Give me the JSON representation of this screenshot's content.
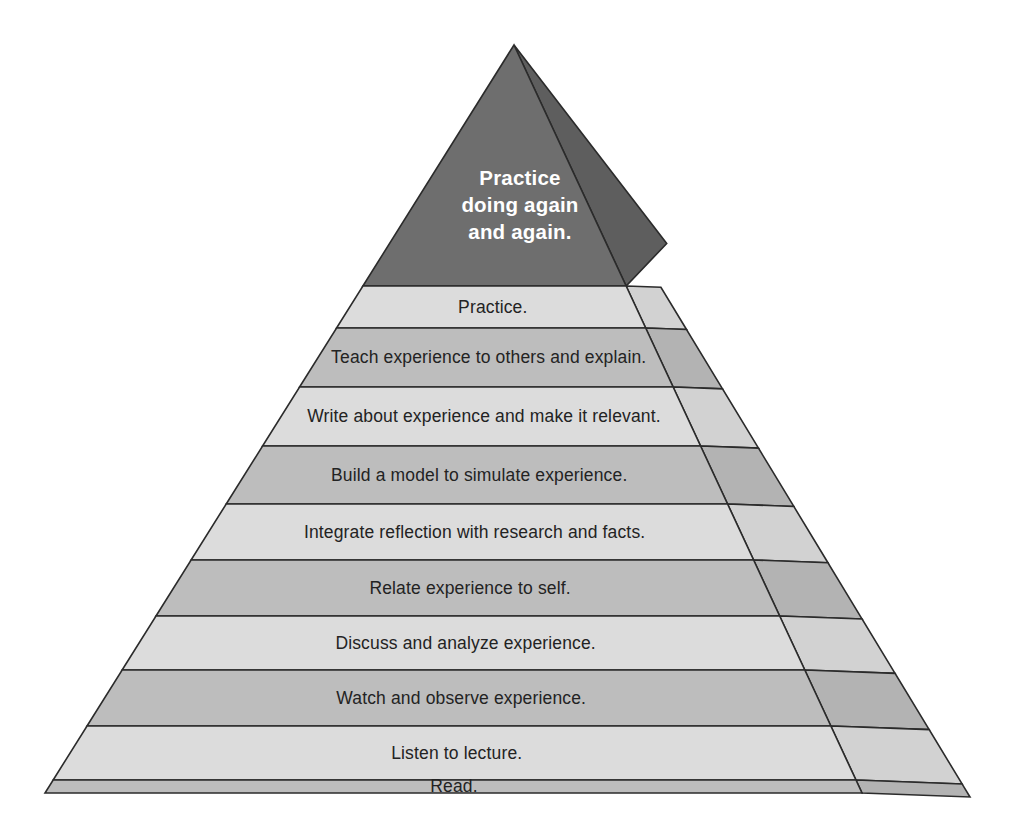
{
  "diagram": {
    "type": "3d-stacked-pyramid",
    "background_color": "#ffffff",
    "outline_color": "#2b2b2b",
    "apex": {
      "lines": [
        "Practice",
        "doing again",
        "and again."
      ],
      "fill_front": "#6e6e6e",
      "fill_side": "#5e5e5e",
      "text_color": "#ffffff"
    },
    "colors": {
      "band_light": "#dcdcdc",
      "band_dark": "#bdbdbd",
      "side_light": "#d2d2d2",
      "side_dark": "#b3b3b3",
      "text": "#232323"
    },
    "bands": [
      {
        "label": "Practice.",
        "tone": "light"
      },
      {
        "label": "Teach experience to others and explain.",
        "tone": "dark"
      },
      {
        "label": "Write about experience and make it relevant.",
        "tone": "light"
      },
      {
        "label": "Build a model to simulate experience.",
        "tone": "dark"
      },
      {
        "label": "Integrate reflection with research and facts.",
        "tone": "light"
      },
      {
        "label": "Relate experience to self.",
        "tone": "dark"
      },
      {
        "label": "Discuss and analyze experience.",
        "tone": "light"
      },
      {
        "label": "Watch and observe experience.",
        "tone": "dark"
      },
      {
        "label": "Listen to lecture.",
        "tone": "light"
      },
      {
        "label": "Read.",
        "tone": "dark"
      }
    ],
    "geometry": {
      "apex_x": 514,
      "apex_y": 45,
      "base_left_x": 45,
      "base_right_x": 862,
      "base_y": 793,
      "ridge_depth_x": 126,
      "ridge_depth_y": -132,
      "side_bottom_x": 970,
      "side_bottom_y": 797,
      "apex_band_bottom_y": 286,
      "band_boundaries_y": [
        286,
        328,
        387,
        446,
        504,
        560,
        616,
        670,
        726,
        780,
        793
      ]
    }
  }
}
